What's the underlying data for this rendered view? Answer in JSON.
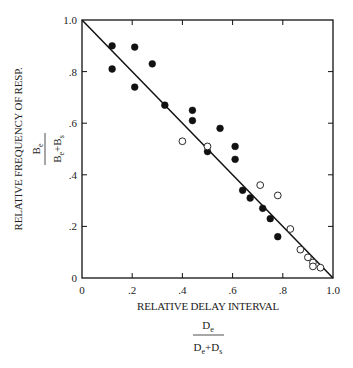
{
  "chart_data": {
    "type": "scatter",
    "title": "",
    "xlabel": "RELATIVE DELAY INTERVAL",
    "xlabel_fraction": {
      "numerator": "De",
      "denominator": "De+Ds"
    },
    "ylabel": "RELATIVE FREQUENCY OF RESP.",
    "ylabel_fraction": {
      "numerator": "Be",
      "denominator": "Be+Bs"
    },
    "xlim": [
      0,
      1.0
    ],
    "ylim": [
      0,
      1.0
    ],
    "x_ticks": [
      "0",
      ".2",
      ".4",
      ".6",
      ".8",
      "1.0"
    ],
    "y_ticks": [
      "0",
      ".2",
      ".4",
      ".6",
      ".8",
      "1.0"
    ],
    "grid": false,
    "legend": null,
    "reference_line": {
      "from": [
        0,
        1.0
      ],
      "to": [
        1.0,
        0
      ],
      "label": ""
    },
    "series": [
      {
        "name": "filled",
        "marker": "filled-circle",
        "points": [
          [
            0.12,
            0.9
          ],
          [
            0.12,
            0.81
          ],
          [
            0.21,
            0.895
          ],
          [
            0.21,
            0.74
          ],
          [
            0.28,
            0.83
          ],
          [
            0.33,
            0.67
          ],
          [
            0.44,
            0.65
          ],
          [
            0.44,
            0.61
          ],
          [
            0.55,
            0.58
          ],
          [
            0.5,
            0.49
          ],
          [
            0.61,
            0.51
          ],
          [
            0.61,
            0.46
          ],
          [
            0.64,
            0.34
          ],
          [
            0.67,
            0.31
          ],
          [
            0.72,
            0.27
          ],
          [
            0.75,
            0.23
          ],
          [
            0.78,
            0.16
          ]
        ]
      },
      {
        "name": "open",
        "marker": "open-circle",
        "points": [
          [
            0.4,
            0.53
          ],
          [
            0.5,
            0.51
          ],
          [
            0.71,
            0.36
          ],
          [
            0.78,
            0.32
          ],
          [
            0.83,
            0.19
          ],
          [
            0.87,
            0.11
          ],
          [
            0.9,
            0.08
          ],
          [
            0.92,
            0.06
          ],
          [
            0.92,
            0.045
          ],
          [
            0.95,
            0.04
          ]
        ]
      }
    ]
  }
}
